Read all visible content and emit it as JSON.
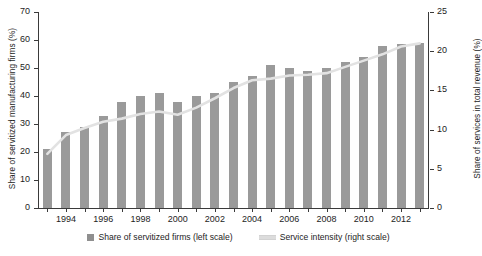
{
  "chart_data": {
    "type": "bar",
    "title": "",
    "xlabel": "",
    "ylabel": "Share of servitized manufacturing firms (%)",
    "y2label": "Share of services in total revenue (%)",
    "ylim": [
      0,
      70
    ],
    "y2lim": [
      0,
      25
    ],
    "grid": false,
    "legend_position": "bottom",
    "x": [
      1993,
      1994,
      1995,
      1996,
      1997,
      1998,
      1999,
      2000,
      2001,
      2002,
      2003,
      2004,
      2005,
      2006,
      2007,
      2008,
      2009,
      2010,
      2011,
      2012,
      2013
    ],
    "categories": [
      "1993",
      "1994",
      "1995",
      "1996",
      "1997",
      "1998",
      "1999",
      "2000",
      "2001",
      "2002",
      "2003",
      "2004",
      "2005",
      "2006",
      "2007",
      "2008",
      "2009",
      "2010",
      "2011",
      "2012",
      "2013"
    ],
    "x_tick_labels": [
      "1994",
      "1996",
      "1998",
      "2000",
      "2002",
      "2004",
      "2006",
      "2008",
      "2010",
      "2012"
    ],
    "x_tick_values": [
      1994,
      1996,
      1998,
      2000,
      2002,
      2004,
      2006,
      2008,
      2010,
      2012
    ],
    "y_tick_labels": [
      "0",
      "10",
      "20",
      "30",
      "40",
      "50",
      "60",
      "70"
    ],
    "y_tick_values": [
      0,
      10,
      20,
      30,
      40,
      50,
      60,
      70
    ],
    "y2_tick_labels": [
      "0",
      "5",
      "10",
      "15",
      "20",
      "25"
    ],
    "y2_tick_values": [
      0,
      5,
      10,
      15,
      20,
      25
    ],
    "series": [
      {
        "name": "Share of servitized firms (left scale)",
        "type": "bar",
        "axis": "left",
        "color": "#9a9a9a",
        "values": [
          21,
          27,
          29,
          33,
          38,
          40,
          41,
          38,
          40,
          41,
          45,
          47,
          51,
          50,
          49,
          50,
          52,
          54,
          58,
          58.5,
          59
        ]
      },
      {
        "name": "Service intensity (right scale)",
        "type": "line",
        "axis": "right",
        "color": "#e2e2e2",
        "values": [
          6.9,
          9.3,
          10.2,
          11.0,
          11.4,
          12.0,
          12.3,
          11.9,
          12.8,
          14.0,
          15.3,
          16.3,
          16.5,
          16.9,
          17.0,
          17.2,
          18.0,
          18.8,
          19.6,
          20.6,
          21.0
        ]
      }
    ]
  },
  "legend": {
    "items": [
      {
        "label": "Share of servitized firms (left scale)",
        "marker": "square",
        "color": "#8f8f8f"
      },
      {
        "label": "Service intensity (right scale)",
        "marker": "line",
        "color": "#dcdcdc"
      }
    ]
  }
}
